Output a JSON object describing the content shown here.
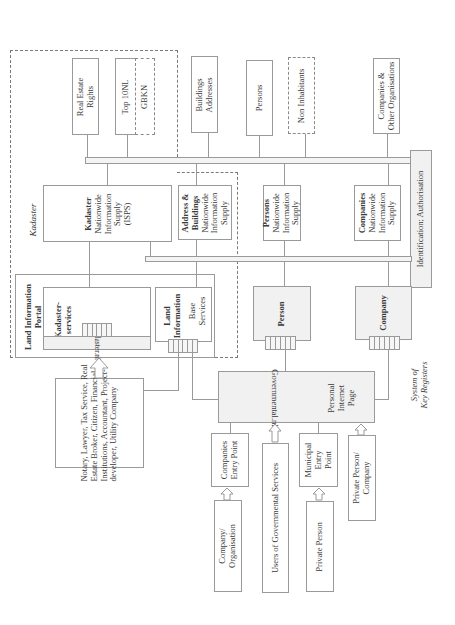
{
  "diagram": {
    "caption": [
      "System of",
      "Key Registers"
    ],
    "kadaster_group_label": "Kadaster",
    "registers": {
      "real_estate_rights": [
        "Real Estate",
        "Rights"
      ],
      "top10nl": "Top 10NL",
      "gbkn": "GBKN",
      "buildings_addresses": [
        "Buildings",
        "Addresses"
      ],
      "persons": "Persons",
      "non_inhabitants": "Non Inhabitants",
      "companies_other": [
        "Companies &",
        "Other Organisations"
      ]
    },
    "identification": "Identification; Authorisation",
    "supplies": {
      "kadaster": {
        "title": "Kadaster",
        "lines": [
          "Nationwide",
          "Information",
          "Supply",
          "(ISPS)"
        ]
      },
      "address_buildings": {
        "title_lines": [
          "Address &",
          "Buildings"
        ],
        "lines": [
          "Nationwide",
          "Information",
          "Supply"
        ]
      },
      "persons": {
        "title": "Persons",
        "lines": [
          "Nationwide",
          "Information",
          "Supply"
        ]
      },
      "companies": {
        "title": "Companies",
        "lines": [
          "Nationwide",
          "Information",
          "Supply"
        ]
      }
    },
    "land_information_portal": {
      "title_lines": [
        "Land Information",
        "Portal"
      ],
      "kadaster_services": [
        "Kadaster-",
        "services"
      ],
      "kadaster_nl": "Kadaster.nl",
      "land_information": [
        "Land",
        "Information"
      ],
      "base_services": [
        "Base",
        "Services"
      ]
    },
    "person_gateway": "Person",
    "company_gateway": "Company",
    "governmental": {
      "label": "Governmental.nl",
      "personal_page": [
        "Personal",
        "Internet",
        "Page"
      ]
    },
    "professional_users": [
      "Notary, Lawyer, Tax Service, Real",
      "Estate Broker, Citizen, Financial",
      "Institutions, Accountant, Project-",
      "developer, Utility Company"
    ],
    "entry_points": {
      "companies_entry": [
        "Companies",
        "Entry Point"
      ],
      "municipal_entry": [
        "Municipal",
        "Entry",
        "Point"
      ]
    },
    "users": {
      "company_organisation": [
        "Company/",
        "Organisation"
      ],
      "users_of_governmental": "Users of Governmental Services",
      "private_person": "Private Person",
      "private_person_company": [
        "Private Person/",
        "Company"
      ]
    }
  }
}
